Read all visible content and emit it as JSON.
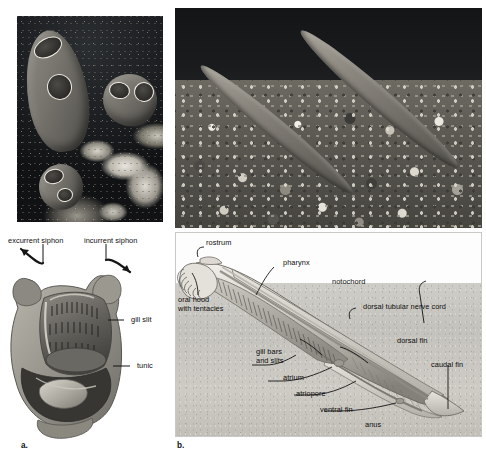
{
  "figure": {
    "panels": [
      {
        "id": "a",
        "id_label": "a.",
        "name": "tunicate-anatomy",
        "photo_caption": "",
        "labels": [
          {
            "key": "excurrent_siphon",
            "text": "excurrent siphon"
          },
          {
            "key": "incurrent_siphon",
            "text": "incurrent siphon"
          },
          {
            "key": "gill_slit",
            "text": "gill slit"
          },
          {
            "key": "tunic",
            "text": "tunic"
          }
        ]
      },
      {
        "id": "b",
        "id_label": "b.",
        "name": "lancelet-anatomy",
        "photo_caption": "",
        "labels": [
          {
            "key": "rostrum",
            "text": "rostrum"
          },
          {
            "key": "pharynx",
            "text": "pharynx"
          },
          {
            "key": "notochord",
            "text": "notochord"
          },
          {
            "key": "dorsal_nerve_cord",
            "text": "dorsal tubular nerve cord"
          },
          {
            "key": "oral_hood",
            "text": "oral hood\nwith tentacles"
          },
          {
            "key": "gill_bars",
            "text": "gill bars\nand slits"
          },
          {
            "key": "atrium",
            "text": "atrium"
          },
          {
            "key": "atriopore",
            "text": "atriopore"
          },
          {
            "key": "ventral_fin",
            "text": "ventral fin"
          },
          {
            "key": "anus",
            "text": "anus"
          },
          {
            "key": "dorsal_fin",
            "text": "dorsal fin"
          },
          {
            "key": "caudal_fin",
            "text": "caudal fin"
          }
        ]
      }
    ],
    "photos": [
      {
        "key": "tunicate_photo",
        "name": "tunicate-colony-photograph",
        "subject": "sea squirts on reef"
      },
      {
        "key": "lancelet_photo",
        "name": "lancelets-in-gravel-photograph",
        "subject": "two lancelets in gravel"
      }
    ],
    "colors": {
      "page_background": "#ffffff",
      "panel_border": "#c9c9c6",
      "substrate": "#c8c5bf",
      "label_text": "#0d0d0d",
      "leader_line": "#1a1a1a"
    }
  }
}
